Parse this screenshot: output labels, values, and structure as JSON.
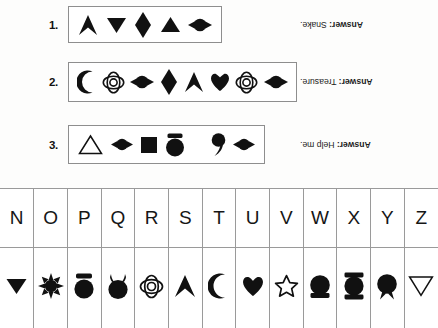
{
  "worksheet": {
    "puzzles": [
      {
        "number": "1.",
        "symbols": [
          "chevron-up",
          "triangle-down-filled",
          "diamond",
          "triangle-up-filled",
          "lens"
        ],
        "answer_prefix": "Answer:",
        "answer_text": " Snake."
      },
      {
        "number": "2.",
        "symbols": [
          "crescent",
          "cloverleaf",
          "lens",
          "diamond",
          "chevron-up",
          "heart",
          "cloverleaf",
          "lens"
        ],
        "answer_prefix": "Answer:",
        "answer_text": " Treasure."
      },
      {
        "number": "3.",
        "symbols": [
          "triangle-up-outline",
          "lens",
          "square-filled",
          "cap-circle",
          "word-space",
          "comma",
          "lens"
        ],
        "answer_prefix": "Answer:",
        "answer_text": " Help me."
      }
    ],
    "key_table": {
      "letters": [
        "N",
        "O",
        "P",
        "Q",
        "R",
        "S",
        "T",
        "U",
        "V",
        "W",
        "X",
        "Y",
        "Z"
      ],
      "symbols": [
        "triangle-down-filled",
        "sunburst",
        "cap-circle",
        "eared-circle",
        "cloverleaf",
        "chevron-up",
        "crescent",
        "heart",
        "star-outline",
        "circle-base",
        "circle-bars",
        "circle-tail",
        "triangle-down-outline"
      ]
    }
  },
  "colors": {
    "ink": "#111111",
    "rule": "#9a9a9a",
    "box_border": "#8e8e8e",
    "paper": "#fdfdfc"
  }
}
